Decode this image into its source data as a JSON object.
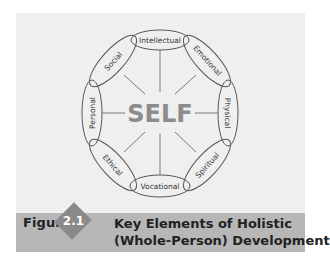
{
  "figure": {
    "label": "Figure",
    "number": "2.1",
    "title_line1": "Key Elements of Holistic",
    "title_line2": "(Whole-Person) Development"
  },
  "diagram": {
    "center_label": "SELF",
    "nodes": [
      {
        "label": "Intellectual",
        "position": "top"
      },
      {
        "label": "Emotional",
        "position": "top-right"
      },
      {
        "label": "Physical",
        "position": "right"
      },
      {
        "label": "Spiritual",
        "position": "bottom-right"
      },
      {
        "label": "Vocational",
        "position": "bottom"
      },
      {
        "label": "Ethical",
        "position": "bottom-left"
      },
      {
        "label": "Personal",
        "position": "left"
      },
      {
        "label": "Social",
        "position": "top-left"
      }
    ]
  },
  "colors": {
    "panel_background": "#efefef",
    "caption_bar": "#b7b7b7",
    "diamond": "#8a8a8a",
    "center_text": "#8c8c8c",
    "lines": "#7a7a7a"
  }
}
